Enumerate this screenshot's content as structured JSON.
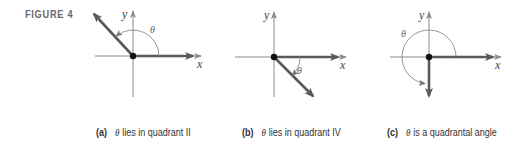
{
  "figure": {
    "label": "FIGURE 4",
    "panels": [
      {
        "id": "a",
        "tag": "(a)",
        "theta": "θ",
        "caption_text": "lies in quadrant II",
        "x_label": "x",
        "y_label": "y",
        "terminal_side": "quadrant II"
      },
      {
        "id": "b",
        "tag": "(b)",
        "theta": "θ",
        "caption_text": "lies in quadrant IV",
        "x_label": "x",
        "y_label": "y",
        "terminal_side": "quadrant IV"
      },
      {
        "id": "c",
        "tag": "(c)",
        "theta": "θ",
        "caption_text": "is a quadrantal angle",
        "x_label": "x",
        "y_label": "y",
        "terminal_side": "negative y-axis"
      }
    ]
  },
  "colors": {
    "axis": "#8a8a8a",
    "ray": "#5a5a5a",
    "label": "#6a6a6a"
  }
}
